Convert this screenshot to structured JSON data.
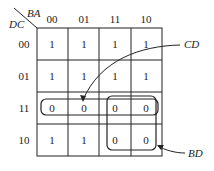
{
  "kmap": {
    "row_var": "DC",
    "col_var": "BA",
    "col_labels": [
      "00",
      "01",
      "11",
      "10"
    ],
    "row_labels": [
      "00",
      "01",
      "11",
      "10"
    ],
    "cells": [
      [
        "1",
        "1",
        "1",
        "1"
      ],
      [
        "1",
        "1",
        "1",
        "1"
      ],
      [
        "0",
        "0",
        "0",
        "0"
      ],
      [
        "1",
        "1",
        "0",
        "0"
      ]
    ]
  },
  "groups": [
    {
      "label": "CD",
      "description": "row 11 (all four zeros)"
    },
    {
      "label": "BD",
      "description": "columns 11,10 in rows 11 and 10"
    }
  ]
}
